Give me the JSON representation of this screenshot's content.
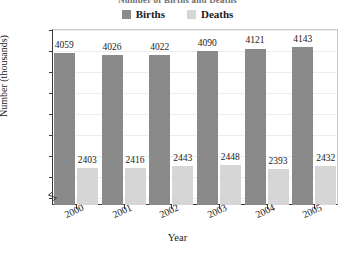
{
  "chart_data": {
    "type": "bar",
    "title": "Number of Births and Deaths",
    "xlabel": "Year",
    "ylabel": "Number (thousands)",
    "categories": [
      "2000",
      "2001",
      "2002",
      "2003",
      "2004",
      "2005"
    ],
    "series": [
      {
        "name": "Births",
        "color": "#8a8a8a",
        "values": [
          4059,
          4026,
          4022,
          4090,
          4121,
          4143
        ]
      },
      {
        "name": "Deaths",
        "color": "#d6d6d6",
        "values": [
          2403,
          2416,
          2443,
          2448,
          2393,
          2432
        ]
      }
    ],
    "ylim": [
      1880,
      4400
    ],
    "yticks": [
      2000,
      2300,
      2600,
      2900,
      3200,
      3500,
      3800,
      4100,
      4400
    ],
    "grid": true,
    "legend_position": "top-center",
    "axis_break": true,
    "data_labels": true
  },
  "legend": {
    "items": [
      {
        "label": "Births",
        "swatch": "dark-gray-square"
      },
      {
        "label": "Deaths",
        "swatch": "light-gray-square"
      }
    ]
  }
}
